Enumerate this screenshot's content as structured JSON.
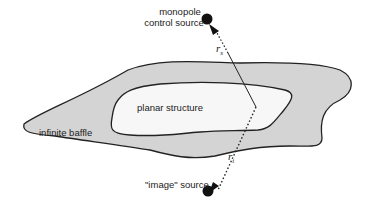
{
  "diagram": {
    "labels": {
      "control_source_line1": "monopole",
      "control_source_line2": "control source",
      "planar_structure": "planar structure",
      "infinite_baffle": "infinite baffle",
      "image_source": "\"image\" source",
      "r_s": "r",
      "r_s_sub": "s",
      "r_i": "r",
      "r_i_sub": "i"
    },
    "colors": {
      "baffle_fill": "#d4d4d4",
      "structure_fill": "#f7f7f7",
      "outline": "#222222"
    }
  }
}
